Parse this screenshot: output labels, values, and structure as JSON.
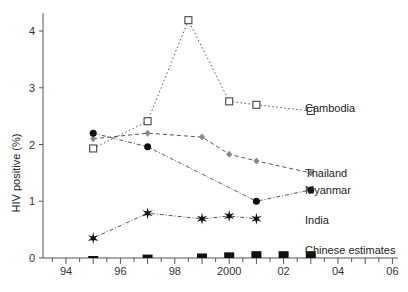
{
  "chart_data": {
    "type": "line",
    "title": "",
    "xlabel": "",
    "ylabel": "HIV positive (%)",
    "xlim": [
      94,
      2006
    ],
    "ylim": [
      0,
      4.3
    ],
    "grid": false,
    "legend_position": "inline labels at right end of each series",
    "x_ticks": [
      1994,
      1996,
      1998,
      2000,
      2002,
      2004,
      2006
    ],
    "x_tick_labels": [
      "94",
      "96",
      "98",
      "2000",
      "02",
      "04",
      "06"
    ],
    "y_ticks": [
      0,
      1,
      2,
      3,
      4
    ],
    "y_tick_labels": [
      "0",
      "1",
      "2",
      "3",
      "4"
    ],
    "series": [
      {
        "name": "Cambodia",
        "marker": "open-square",
        "line": "dotted",
        "x": [
          1995,
          1997,
          1998.5,
          2000,
          2001,
          2003
        ],
        "values": [
          1.93,
          2.41,
          4.19,
          2.76,
          2.7,
          2.59
        ]
      },
      {
        "name": "Thailand",
        "marker": "grey-diamond",
        "line": "dashed",
        "x": [
          1995,
          1997,
          1999,
          2000,
          2001,
          2003
        ],
        "values": [
          2.1,
          2.2,
          2.13,
          1.83,
          1.71,
          1.5
        ]
      },
      {
        "name": "Myanmar",
        "marker": "filled-circle",
        "line": "dash-dot",
        "x": [
          1995,
          1997,
          2001,
          2003
        ],
        "values": [
          2.2,
          1.96,
          1.0,
          1.2
        ]
      },
      {
        "name": "India",
        "marker": "star",
        "line": "dash-dot",
        "x": [
          1995,
          1997,
          1999,
          2000,
          2001
        ],
        "values": [
          0.35,
          0.79,
          0.69,
          0.74,
          0.69
        ]
      },
      {
        "name": "Chinese estimates",
        "marker": "filled-bar",
        "line": "none",
        "x": [
          1995,
          1997,
          1999,
          2000,
          2001,
          2002,
          2003
        ],
        "values": [
          0.02,
          0.06,
          0.08,
          0.1,
          0.12,
          0.12,
          0.12
        ]
      }
    ]
  }
}
